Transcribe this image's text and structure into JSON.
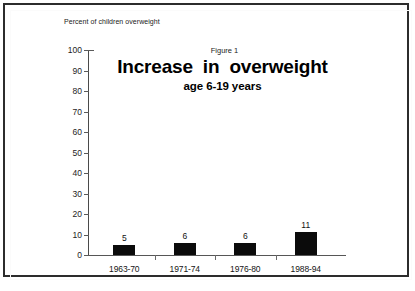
{
  "chart_data": {
    "type": "bar",
    "title": "Increase in overweight",
    "subtitle": "age 6-19 years",
    "figure_number": "Figure 1",
    "ylabel": "Percent of children overweight",
    "xlabel": "",
    "categories": [
      "1963-70",
      "1971-74",
      "1976-80",
      "1988-94"
    ],
    "values": [
      5,
      6,
      6,
      11
    ],
    "value_labels": [
      "5",
      "6",
      "6",
      "11"
    ],
    "ylim": [
      0,
      100
    ],
    "ytick_labels": [
      "0",
      "10",
      "20",
      "30",
      "40",
      "50",
      "60",
      "70",
      "80",
      "90",
      "100"
    ],
    "ytick_values": [
      0,
      10,
      20,
      30,
      40,
      50,
      60,
      70,
      80,
      90,
      100
    ],
    "grid": false,
    "legend": null,
    "bar_color": "#0b0b0b",
    "axis_color": "#4a4a4a",
    "background": "#ffffff"
  }
}
